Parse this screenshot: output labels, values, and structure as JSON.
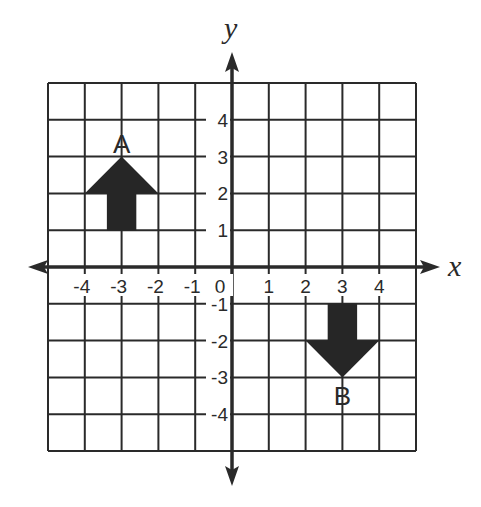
{
  "diagram": {
    "type": "coordinate-plane",
    "x_axis": {
      "label": "x",
      "ticks": [
        "-4",
        "-3",
        "-2",
        "-1",
        "0",
        "1",
        "2",
        "3",
        "4"
      ]
    },
    "y_axis": {
      "label": "y",
      "ticks": [
        "4",
        "3",
        "2",
        "1",
        "-1",
        "-2",
        "-3",
        "-4"
      ]
    },
    "grid": {
      "xmin": -5,
      "xmax": 5,
      "ymin": -5,
      "ymax": 5
    },
    "shapes": [
      {
        "name": "A",
        "label": "A",
        "direction": "up",
        "tip": [
          -3,
          3
        ],
        "head_base": [
          [
            -4,
            2
          ],
          [
            -2,
            2
          ]
        ],
        "stem": {
          "x": [
            -3.4,
            -2.6
          ],
          "y": [
            1,
            2
          ]
        }
      },
      {
        "name": "B",
        "label": "B",
        "direction": "down",
        "tip": [
          3,
          -3
        ],
        "head_base": [
          [
            2,
            -2
          ],
          [
            4,
            -2
          ]
        ],
        "stem": {
          "x": [
            2.6,
            3.4
          ],
          "y": [
            -1,
            -2
          ]
        }
      }
    ],
    "colors": {
      "ink": "#2a2a2a",
      "fill": "#262626",
      "background": "#ffffff"
    }
  }
}
